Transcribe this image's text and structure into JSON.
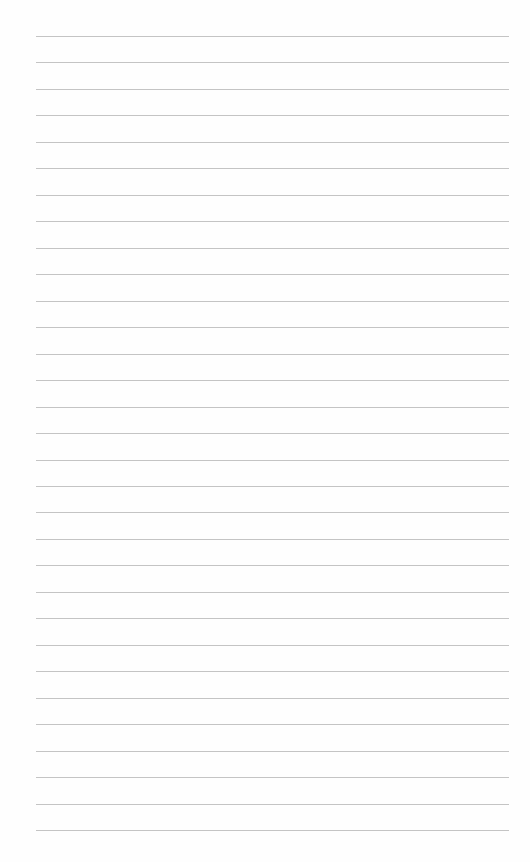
{
  "page": {
    "type": "lined-notepaper",
    "background_color": "#fefefe",
    "line_color": "#c4c4c4",
    "line_count": 31,
    "first_line_y": 36,
    "line_spacing": 26.47,
    "line_left": 36,
    "line_right": 509,
    "lines": []
  }
}
